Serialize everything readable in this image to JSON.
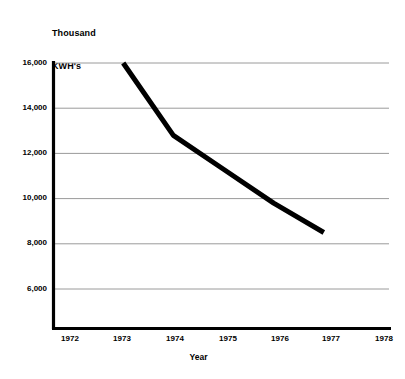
{
  "chart_data": {
    "type": "line",
    "title": "Thousand KWH's",
    "title_lines": [
      "Thousand",
      "KWH's"
    ],
    "xlabel": "Year",
    "ylabel": "Thousand KWH's",
    "x": [
      1973,
      1974,
      1975,
      1976,
      1977
    ],
    "values": [
      16000,
      12800,
      11300,
      9800,
      8500
    ],
    "series": [
      {
        "name": "Thousand KWH's",
        "x": [
          1973,
          1974,
          1975,
          1976,
          1977
        ],
        "values": [
          16000,
          12800,
          11300,
          9800,
          8500
        ]
      }
    ],
    "xlim": [
      1971.6,
      1978.3
    ],
    "ylim": [
      4600,
      16000
    ],
    "x_tick_labels": [
      "1972",
      "1973",
      "1974",
      "1975",
      "1976",
      "1977",
      "1978"
    ],
    "x_ticks": [
      1972,
      1973,
      1974,
      1975,
      1976,
      1977,
      1978
    ],
    "y_tick_labels": [
      "16,000",
      "14,000",
      "12,000",
      "10,000",
      "8,000",
      "6,000"
    ],
    "y_ticks": [
      16000,
      14000,
      12000,
      10000,
      8000,
      6000
    ],
    "grid": "horizontal",
    "legend": "none",
    "line_color": "#000000",
    "line_width_px": 5,
    "grid_color": "#9a9a9a",
    "axis_color": "#000000",
    "background_color": "#ffffff"
  },
  "axis": {
    "y_labels": [
      {
        "text": "16,000",
        "value": 16000
      },
      {
        "text": "14,000",
        "value": 14000
      },
      {
        "text": "12,000",
        "value": 12000
      },
      {
        "text": "10,000",
        "value": 10000
      },
      {
        "text": "8,000",
        "value": 8000
      },
      {
        "text": "6,000",
        "value": 6000
      }
    ],
    "x_labels": [
      {
        "text": "1972",
        "value": 1972
      },
      {
        "text": "1973",
        "value": 1973
      },
      {
        "text": "1974",
        "value": 1974
      },
      {
        "text": "1975",
        "value": 1975
      },
      {
        "text": "1976",
        "value": 1976
      },
      {
        "text": "1977",
        "value": 1977
      },
      {
        "text": "1978",
        "value": 1978
      }
    ],
    "x_title": "Year"
  }
}
